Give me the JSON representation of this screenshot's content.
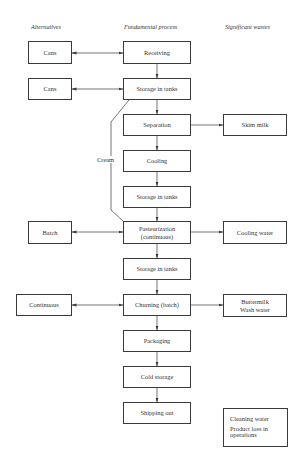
{
  "headers": {
    "alternatives": "Alternatives",
    "fundamental": "Fundamental process",
    "wastes": "Significant wastes"
  },
  "process": [
    {
      "label": "Receiving"
    },
    {
      "label": "Storage in tanks"
    },
    {
      "label": "Separation"
    },
    {
      "label": "Cooling"
    },
    {
      "label": "Storage in tanks"
    },
    {
      "label": "Pasteurization",
      "label2": "(continuous)"
    },
    {
      "label": "Storage in tanks"
    },
    {
      "label": "Churning (batch)"
    },
    {
      "label": "Packaging"
    },
    {
      "label": "Cold storage"
    },
    {
      "label": "Shipping out"
    }
  ],
  "alternatives": [
    {
      "label": "Cans",
      "links_to": "Receiving"
    },
    {
      "label": "Cans",
      "links_to": "Storage in tanks"
    },
    {
      "label": "Batch",
      "links_to": "Pasteurization (continuous)"
    },
    {
      "label": "Continuous",
      "links_to": "Churning (batch)"
    }
  ],
  "wastes": [
    {
      "label": "Skim milk",
      "from": "Separation"
    },
    {
      "label": "Cooling water",
      "from": "Pasteurization (continuous)"
    },
    {
      "label": "Buttermilk",
      "label2": "Wash water",
      "from": "Churning (batch)"
    },
    {
      "label": "Cleaning water",
      "label2": "Product loss in",
      "label3": "operations"
    }
  ],
  "bypass": {
    "label": "Cream"
  },
  "colors": {
    "line": "#3a3a3a",
    "background": "#ffffff",
    "text": "#333333"
  }
}
